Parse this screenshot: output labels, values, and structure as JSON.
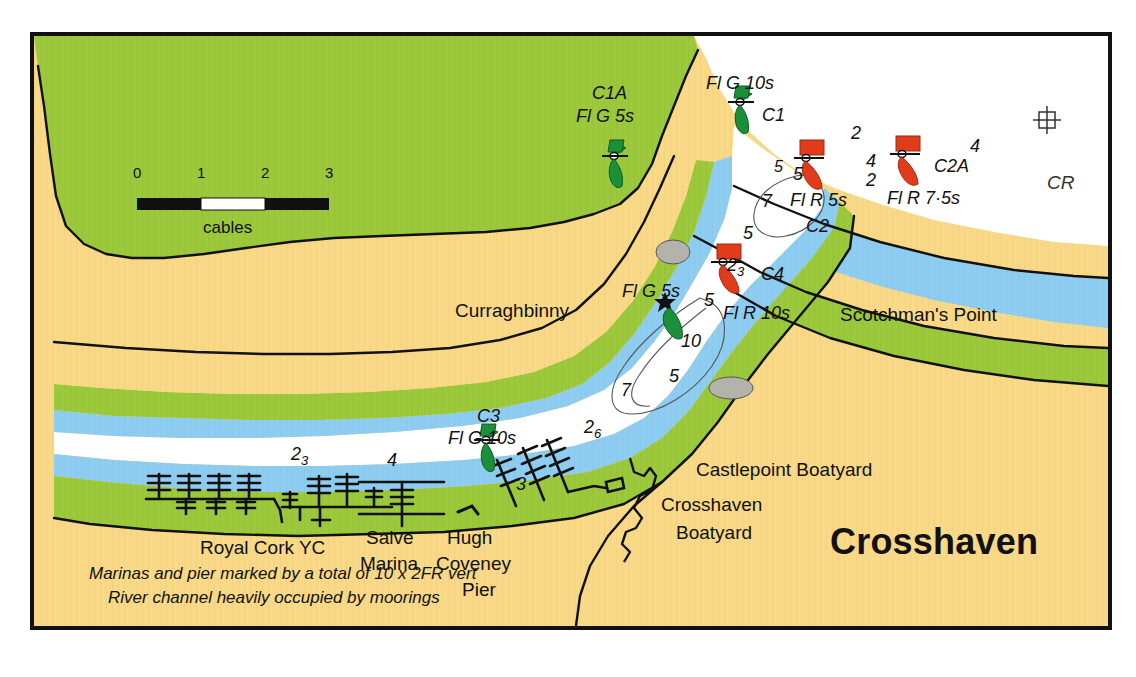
{
  "chart": {
    "title": "Crosshaven",
    "scale_bar": {
      "caption": "cables",
      "ticks": [
        "0",
        "1",
        "2",
        "3"
      ]
    },
    "notes": [
      "Marinas and pier marked by a total of 10 x 2FR vert",
      "River channel heavily occupied by moorings"
    ],
    "colors": {
      "land": "#f7d987",
      "vegetation": "#9cc83c",
      "shallow_water": "#8ecdf0",
      "deep_water": "#ffffff",
      "rock": "#b0b0a8",
      "starboard_buoy": "#1b8f3a",
      "port_buoy": "#e03b1b",
      "frame": "#111111"
    },
    "places": [
      {
        "id": "curraghbinny",
        "label": "Curraghbinny",
        "x": 451,
        "y": 284,
        "size": 19,
        "align": "left"
      },
      {
        "id": "scotchmans-point",
        "label": "Scotchman's Point",
        "x": 836,
        "y": 288,
        "size": 19,
        "align": "left"
      },
      {
        "id": "castlepoint-boatyard",
        "label": "Castlepoint Boatyard",
        "x": 692,
        "y": 443,
        "size": 19,
        "align": "left"
      },
      {
        "id": "crosshaven-boatyard-1",
        "label": "Crosshaven",
        "x": 657,
        "y": 478,
        "size": 19,
        "align": "left"
      },
      {
        "id": "crosshaven-boatyard-2",
        "label": "Boatyard",
        "x": 672,
        "y": 506,
        "size": 19,
        "align": "left"
      },
      {
        "id": "royal-cork-yc",
        "label": "Royal Cork YC",
        "x": 196,
        "y": 521,
        "size": 19,
        "align": "left"
      },
      {
        "id": "salve-marina-1",
        "label": "Salve",
        "x": 362,
        "y": 511,
        "size": 19,
        "align": "left"
      },
      {
        "id": "salve-marina-2",
        "label": "Marina",
        "x": 356,
        "y": 537,
        "size": 19,
        "align": "left"
      },
      {
        "id": "hugh-coveney-1",
        "label": "Hugh",
        "x": 443,
        "y": 511,
        "size": 19,
        "align": "left"
      },
      {
        "id": "hugh-coveney-2",
        "label": "Coveney",
        "x": 432,
        "y": 537,
        "size": 19,
        "align": "left"
      },
      {
        "id": "hugh-coveney-3",
        "label": "Pier",
        "x": 458,
        "y": 563,
        "size": 19,
        "align": "left"
      }
    ],
    "buoys": [
      {
        "id": "c1",
        "name": "C1",
        "light": "Fl G 10s",
        "type": "starboard",
        "bx": 736,
        "by": 98,
        "name_x": 758,
        "name_y": 89,
        "light_x": 702,
        "light_y": 57
      },
      {
        "id": "c1a",
        "name": "C1A",
        "light": "Fl G 5s",
        "type": "starboard",
        "bx": 610,
        "by": 112,
        "name_x": 588,
        "name_y": 67,
        "light_x": 572,
        "light_y": 90
      },
      {
        "id": "c2",
        "name": "C2",
        "light": "Fl R 5s",
        "type": "port",
        "bx": 812,
        "by": 152,
        "name_x": 802,
        "name_y": 200,
        "light_x": 786,
        "light_y": 174
      },
      {
        "id": "c2a",
        "name": "C2A",
        "light": "Fl R 7·5s",
        "type": "port",
        "bx": 908,
        "by": 147,
        "name_x": 930,
        "name_y": 140,
        "light_x": 883,
        "light_y": 172
      },
      {
        "id": "c4",
        "name": "C4",
        "light": "Fl R 10s",
        "type": "port",
        "bx": 729,
        "by": 256,
        "name_x": 757,
        "name_y": 248,
        "light_x": 719,
        "light_y": 287
      },
      {
        "id": "c3",
        "name": "C3",
        "light": "Fl G 10s",
        "type": "starboard",
        "bx": 482,
        "by": 434,
        "name_x": 473,
        "name_y": 390,
        "light_x": 444,
        "light_y": 412
      }
    ],
    "beacon": {
      "id": "curraghbinny-beacon",
      "light": "Fl G 5s",
      "bx": 661,
      "by": 288,
      "light_x": 618,
      "light_y": 265
    },
    "cr_mark": {
      "label": "CR",
      "x": 1043,
      "y": 116
    },
    "soundings": [
      {
        "v": "2",
        "sub": "",
        "x": 847,
        "y": 107
      },
      {
        "v": "4",
        "sub": "",
        "x": 862,
        "y": 135
      },
      {
        "v": "4",
        "sub": "",
        "x": 966,
        "y": 120
      },
      {
        "v": "2",
        "sub": "",
        "x": 862,
        "y": 154
      },
      {
        "v": "5",
        "sub": "",
        "x": 789,
        "y": 148
      },
      {
        "v": "7",
        "sub": "",
        "x": 758,
        "y": 175
      },
      {
        "v": "5",
        "sub": "",
        "x": 739,
        "y": 207
      },
      {
        "v": "2",
        "sub": "3",
        "x": 723,
        "y": 239
      },
      {
        "v": "5",
        "sub": "",
        "x": 700,
        "y": 274
      },
      {
        "v": "10",
        "sub": "",
        "x": 683,
        "y": 315
      },
      {
        "v": "5",
        "sub": "",
        "x": 665,
        "y": 350
      },
      {
        "v": "7",
        "sub": "",
        "x": 617,
        "y": 364
      },
      {
        "v": "2",
        "sub": "6",
        "x": 580,
        "y": 401
      },
      {
        "v": "3",
        "sub": "",
        "x": 512,
        "y": 458
      },
      {
        "v": "2",
        "sub": "3",
        "x": 287,
        "y": 428
      },
      {
        "v": "4",
        "sub": "",
        "x": 383,
        "y": 434
      }
    ]
  }
}
